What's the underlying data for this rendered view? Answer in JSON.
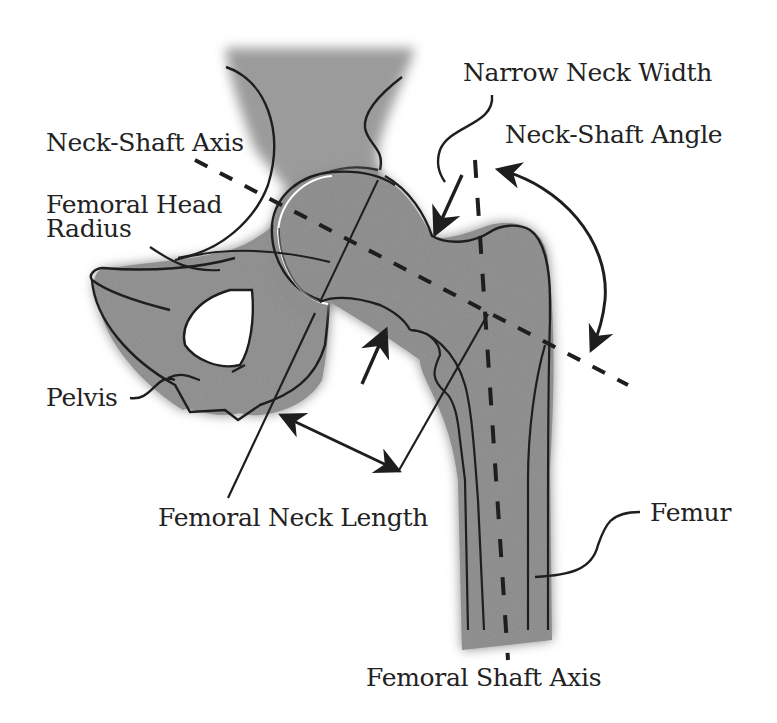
{
  "diagram": {
    "colors": {
      "bone_fill": "#8e8e8e",
      "bone_fill_dark": "#6f6f6f",
      "outline": "#1e1e1e",
      "background": "#ffffff"
    },
    "labels": {
      "neck_shaft_axis": "Neck-Shaft Axis",
      "femoral_head_radius_line1": "Femoral Head",
      "femoral_head_radius_line2": "Radius",
      "pelvis": "Pelvis",
      "narrow_neck_width": "Narrow Neck Width",
      "neck_shaft_angle": "Neck-Shaft Angle",
      "femoral_neck_length": "Femoral Neck Length",
      "femur": "Femur",
      "femoral_shaft_axis": "Femoral Shaft Axis"
    }
  }
}
